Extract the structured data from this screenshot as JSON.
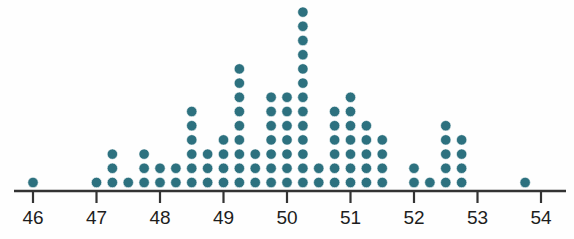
{
  "figure": {
    "name": "dot-plot",
    "background_color": "#fefefe"
  },
  "chart_data": {
    "type": "scatter",
    "plot_style": "dotplot",
    "title": "",
    "subtitle": "",
    "xlabel": "",
    "ylabel": "",
    "xlim": [
      45.6,
      54.4
    ],
    "ylim": [
      0,
      13
    ],
    "grid": false,
    "legend": null,
    "dot_color": "#2d717f",
    "dot_edge_color": "#ffffff",
    "dot_radius_px": 5.2,
    "dot_spacing_px": 15.85,
    "stack_spacing_px": 14.2,
    "axis_color": "#333333",
    "axis_y_px": 191,
    "tick_length_px": 12,
    "unit_px": 63.5,
    "origin_x_px": 33,
    "bin_width": 0.25,
    "x_ticks": [
      46,
      47,
      48,
      49,
      50,
      51,
      52,
      53,
      54
    ],
    "x_tick_labels": [
      "46",
      "47",
      "48",
      "49",
      "50",
      "51",
      "52",
      "53",
      "54"
    ],
    "x": [
      46.0,
      47.0,
      47.25,
      47.5,
      47.75,
      48.0,
      48.25,
      48.5,
      48.75,
      49.0,
      49.25,
      49.5,
      49.75,
      50.0,
      50.25,
      50.5,
      50.75,
      51.0,
      51.25,
      51.5,
      52.0,
      52.25,
      52.5,
      52.75,
      53.75
    ],
    "counts": [
      1,
      1,
      3,
      1,
      3,
      2,
      2,
      6,
      3,
      4,
      9,
      3,
      7,
      7,
      13,
      2,
      6,
      7,
      5,
      4,
      2,
      1,
      5,
      4,
      1
    ],
    "total_count": 103
  }
}
